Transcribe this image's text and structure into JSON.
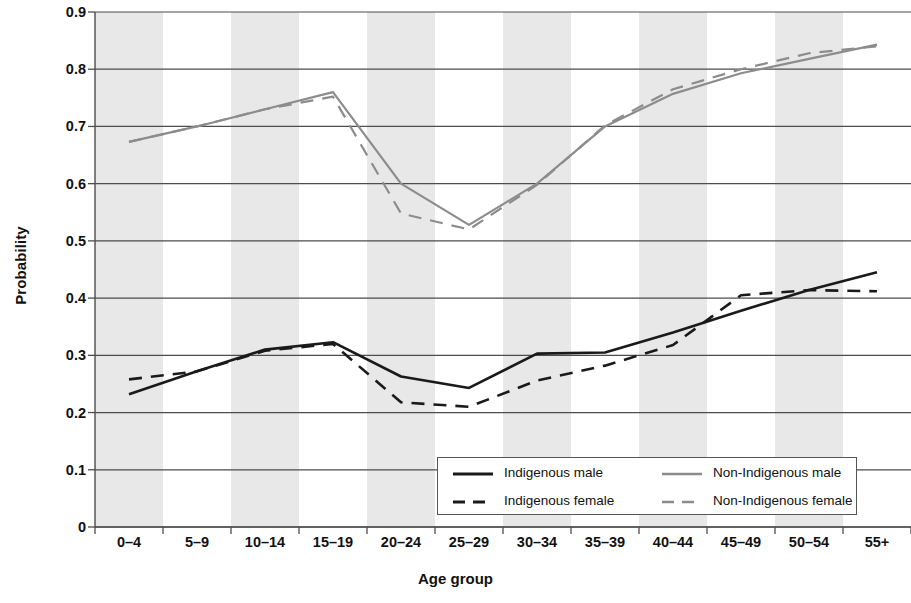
{
  "chart_data": {
    "type": "line",
    "title": "",
    "xlabel": "Age group",
    "ylabel": "Probability",
    "ylim": [
      0,
      0.9
    ],
    "ytick_labels": [
      "0.9",
      "0.8",
      "0.7",
      "0.6",
      "0.5",
      "0.4",
      "0.3",
      "0.2",
      "0.1",
      "0"
    ],
    "ytick_values": [
      0.9,
      0.8,
      0.7,
      0.6,
      0.5,
      0.4,
      0.3,
      0.2,
      0.1,
      0
    ],
    "grid": true,
    "banded_background": true,
    "legend_position": "bottom-center",
    "categories": [
      "0–4",
      "5–9",
      "10–14",
      "15–19",
      "20–24",
      "25–29",
      "30–34",
      "35–39",
      "40–44",
      "45–49",
      "50–54",
      "55+"
    ],
    "series": [
      {
        "name": "Indigenous male",
        "color": "#1a1a1a",
        "dash": "solid",
        "values": [
          0.232,
          0.272,
          0.31,
          0.323,
          0.263,
          0.243,
          0.303,
          0.305,
          0.34,
          0.378,
          0.414,
          0.445
        ]
      },
      {
        "name": "Indigenous female",
        "color": "#1a1a1a",
        "dash": "dashed",
        "values": [
          0.258,
          0.272,
          0.308,
          0.32,
          0.218,
          0.21,
          0.256,
          0.282,
          0.318,
          0.405,
          0.414,
          0.412
        ]
      },
      {
        "name": "Non-Indigenous male",
        "color": "#8c8c8c",
        "dash": "solid",
        "values": [
          0.673,
          0.7,
          0.73,
          0.76,
          0.6,
          0.528,
          0.6,
          0.7,
          0.757,
          0.793,
          0.818,
          0.843
        ]
      },
      {
        "name": "Non-Indigenous female",
        "color": "#8c8c8c",
        "dash": "dashed",
        "values": [
          0.673,
          0.7,
          0.73,
          0.752,
          0.548,
          0.52,
          0.598,
          0.702,
          0.765,
          0.8,
          0.828,
          0.84
        ]
      }
    ]
  },
  "legend": {
    "entries": [
      {
        "label": "Indigenous male"
      },
      {
        "label": "Non-Indigenous male"
      },
      {
        "label": "Indigenous female"
      },
      {
        "label": "Non-Indigenous female"
      }
    ]
  },
  "axes": {
    "y_title": "Probability",
    "x_title": "Age group"
  },
  "colors": {
    "indigenous": "#1a1a1a",
    "non_indigenous": "#8c8c8c",
    "band": "#e8e8e8",
    "gridline": "#4d4d4d",
    "axis": "#4d4d4d"
  }
}
